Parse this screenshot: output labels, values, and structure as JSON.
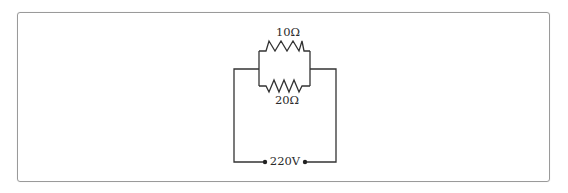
{
  "diagram": {
    "type": "electric-circuit",
    "components": [
      {
        "id": "R1",
        "kind": "resistor",
        "label": "10Ω",
        "position": "upper-branch"
      },
      {
        "id": "R2",
        "kind": "resistor",
        "label": "20Ω",
        "position": "lower-branch"
      },
      {
        "id": "V1",
        "kind": "voltage-source-terminals",
        "label": "220V",
        "position": "bottom"
      }
    ],
    "connection": "R1 parallel R2, series with 220V source",
    "colors": {
      "wire": "#333333",
      "frame_border": "#9a9a9a",
      "background": "#ffffff"
    }
  },
  "labels": {
    "r1": "10Ω",
    "r2": "20Ω",
    "source": "220V"
  }
}
